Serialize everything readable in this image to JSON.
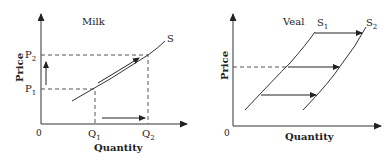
{
  "panels": [
    {
      "title": "Milk",
      "y_label": "Price",
      "x_label": "Quantity",
      "origin": "0",
      "curve_label": "S",
      "price_ticks": {
        "p2": "P",
        "p2_sub": "2",
        "p1": "P",
        "p1_sub": "1"
      },
      "quantity_ticks": {
        "q1": "Q",
        "q1_sub": "1",
        "q2": "Q",
        "q2_sub": "2"
      }
    },
    {
      "title": "Veal",
      "y_label": "Price",
      "x_label": "Quantity",
      "origin": "0",
      "curve1_label": "S",
      "curve1_sub": "1",
      "curve2_label": "S",
      "curve2_sub": "2"
    }
  ],
  "colors": {
    "line": "#333333",
    "text": "#222222",
    "background": "#ffffff"
  }
}
